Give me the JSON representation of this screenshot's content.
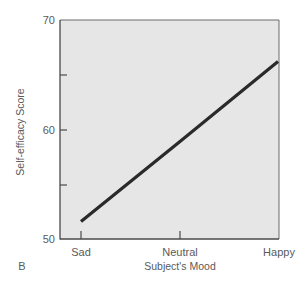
{
  "chart_data": {
    "type": "line",
    "title": "",
    "panel_label": "B",
    "xlabel": "Subject's Mood",
    "ylabel": "Self-efficacy Score",
    "categories": [
      "Sad",
      "Neutral",
      "Happy"
    ],
    "series": [
      {
        "name": "Self-efficacy",
        "values": [
          51.6,
          58.9,
          66.2
        ],
        "color": "#2a2a2a"
      }
    ],
    "ylim": [
      50,
      70
    ],
    "yticks": [
      50,
      55,
      60,
      65,
      70
    ],
    "ytick_labels": [
      "50",
      "",
      "60",
      "",
      "70"
    ],
    "grid": false,
    "legend": "none",
    "plot_background": "#e6e6e6"
  },
  "labels": {
    "panel": "B",
    "xlabel": "Subject's Mood",
    "ylabel": "Self-efficacy Score",
    "ytick_70": "70",
    "ytick_60": "60",
    "ytick_50": "50",
    "xtick_sad": "Sad",
    "xtick_neutral": "Neutral",
    "xtick_happy": "Happy"
  }
}
